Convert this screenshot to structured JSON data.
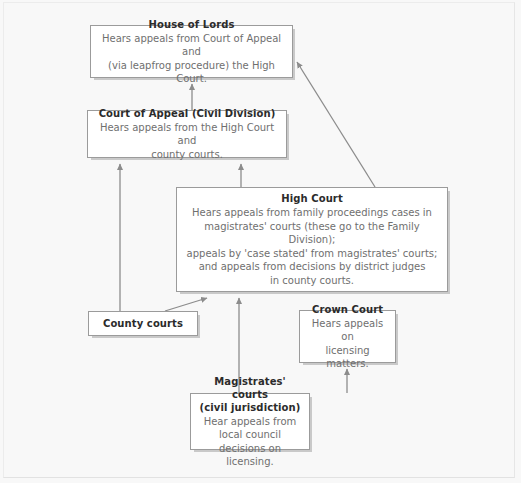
{
  "diagram": {
    "type": "hierarchy-flowchart",
    "background_color": "#f8f8f8",
    "box_fill_color": "#ffffff",
    "box_border_color": "#9b9b9b",
    "arrow_color": "#8c8c8c",
    "title_text_color": "#2b2b2b",
    "body_text_color": "#6f6f6f",
    "nodes": [
      {
        "id": "house-of-lords",
        "title": "House of Lords",
        "body": "Hears appeals from Court of Appeal and\n(via leapfrog procedure) the High Court."
      },
      {
        "id": "court-of-appeal",
        "title": "Court of Appeal (Civil Division)",
        "body": "Hears appeals from the High Court and\ncounty courts."
      },
      {
        "id": "high-court",
        "title": "High Court",
        "body": "Hears appeals from family proceedings cases in\nmagistrates' courts (these go to the Family Division);\nappeals by 'case stated' from magistrates' courts;\nand appeals from decisions by district judges\nin county courts."
      },
      {
        "id": "county-courts",
        "title": "County courts",
        "body": ""
      },
      {
        "id": "crown-court",
        "title": "Crown Court",
        "body": "Hears appeals on\nlicensing matters."
      },
      {
        "id": "magistrates-courts",
        "title": "Magistrates' courts\n(civil jurisdiction)",
        "body": "Hear appeals from local council\ndecisions on licensing."
      }
    ],
    "edges": [
      {
        "id": "court-of-appeal-to-house-of-lords",
        "from": "court-of-appeal",
        "to": "house-of-lords"
      },
      {
        "id": "high-court-to-house-of-lords",
        "from": "high-court",
        "to": "house-of-lords"
      },
      {
        "id": "high-court-to-court-of-appeal",
        "from": "high-court",
        "to": "court-of-appeal"
      },
      {
        "id": "county-courts-to-court-of-appeal",
        "from": "county-courts",
        "to": "court-of-appeal"
      },
      {
        "id": "county-courts-to-high-court",
        "from": "county-courts",
        "to": "high-court"
      },
      {
        "id": "magistrates-courts-to-high-court",
        "from": "magistrates-courts",
        "to": "high-court"
      },
      {
        "id": "magistrates-courts-to-crown-court",
        "from": "magistrates-courts",
        "to": "crown-court"
      }
    ]
  }
}
